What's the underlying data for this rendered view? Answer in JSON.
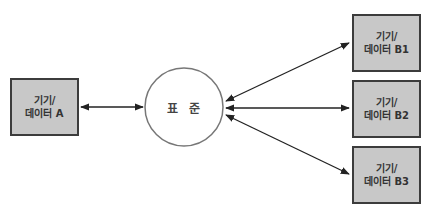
{
  "diagram": {
    "center": {
      "label": "표 준"
    },
    "source": {
      "line1": "기기/",
      "line2": "데이터 A"
    },
    "targets": [
      {
        "line1": "기기/",
        "line2": "데이터 B1"
      },
      {
        "line1": "기기/",
        "line2": "데이터 B2"
      },
      {
        "line1": "기기/",
        "line2": "데이터 B3"
      }
    ],
    "colors": {
      "box_fill": "#c8c8c8",
      "box_border": "#3c3c3c",
      "line": "#222222",
      "circle": "#777777"
    }
  }
}
